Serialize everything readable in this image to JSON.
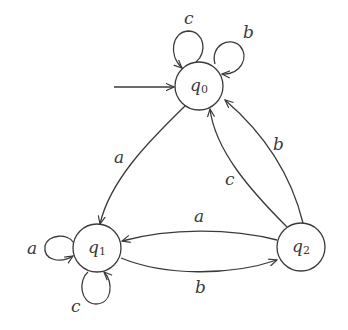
{
  "diagram": {
    "type": "finite-automaton",
    "initial_state": "q0",
    "states": [
      {
        "id": "q0",
        "label": "q",
        "sub": "0",
        "cx": 199,
        "cy": 86
      },
      {
        "id": "q1",
        "label": "q",
        "sub": "1",
        "cx": 97,
        "cy": 248
      },
      {
        "id": "q2",
        "label": "q",
        "sub": "2",
        "cx": 301,
        "cy": 247
      }
    ],
    "transitions": [
      {
        "from": "q0",
        "to": "q0",
        "symbol": "c"
      },
      {
        "from": "q0",
        "to": "q0",
        "symbol": "b"
      },
      {
        "from": "q0",
        "to": "q1",
        "symbol": "a"
      },
      {
        "from": "q2",
        "to": "q0",
        "symbol": "c"
      },
      {
        "from": "q2",
        "to": "q0",
        "symbol": "b"
      },
      {
        "from": "q2",
        "to": "q1",
        "symbol": "a"
      },
      {
        "from": "q1",
        "to": "q2",
        "symbol": "b"
      },
      {
        "from": "q1",
        "to": "q1",
        "symbol": "a"
      },
      {
        "from": "q1",
        "to": "q1",
        "symbol": "c"
      }
    ]
  },
  "labels": {
    "q0_loop_c": "c",
    "q0_loop_b": "b",
    "q0_to_q1": "a",
    "q2_to_q0_c": "c",
    "q2_to_q0_b": "b",
    "q2_to_q1": "a",
    "q1_to_q2": "b",
    "q1_loop_a": "a",
    "q1_loop_c": "c",
    "q0": {
      "main": "q",
      "sub": "0"
    },
    "q1": {
      "main": "q",
      "sub": "1"
    },
    "q2": {
      "main": "q",
      "sub": "2"
    }
  }
}
